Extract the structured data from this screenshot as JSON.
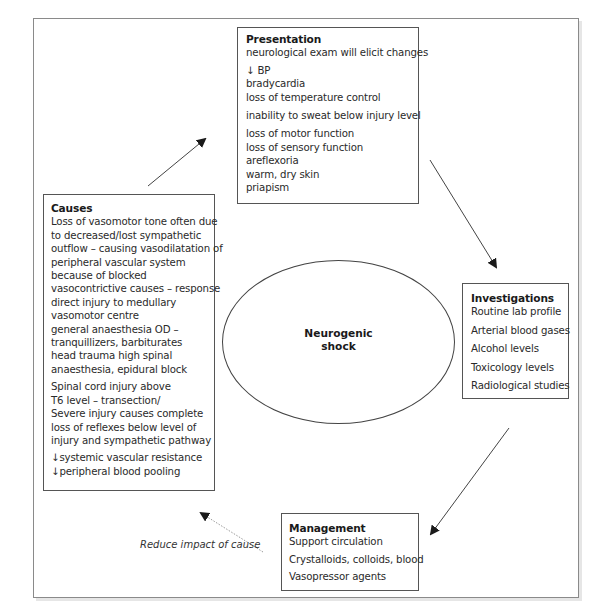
{
  "diagram": {
    "center": {
      "line1": "Neurogenic",
      "line2": "shock"
    },
    "presentation": {
      "title": "Presentation",
      "items": [
        "neurological exam will elicit changes",
        "↓ BP",
        "bradycardia",
        "loss of temperature control",
        "inability to sweat below injury level",
        "loss of motor function",
        "loss of sensory function",
        "areflexoria",
        "warm, dry skin",
        "priapism"
      ]
    },
    "causes": {
      "title": "Causes",
      "items": [
        "Loss of vasomotor tone often due",
        "to decreased/lost sympathetic",
        "outflow – causing vasodilatation of",
        "peripheral vascular system",
        "because of blocked",
        "vasocontrictive causes – response",
        "direct injury to medullary",
        "vasomotor centre",
        "general anaesthesia OD –",
        "tranquillizers, barbiturates",
        "head trauma high spinal",
        "anaesthesia, epidural block",
        "Spinal cord injury above",
        "T6 level – transection/",
        "Severe injury causes complete",
        "loss of reflexes below level of",
        "injury and sympathetic pathway",
        "↓systemic vascular resistance",
        "↓peripheral blood pooling"
      ]
    },
    "investigations": {
      "title": "Investigations",
      "items": [
        "Routine lab profile",
        "Arterial blood gases",
        "Alcohol levels",
        "Toxicology levels",
        "Radiological studies"
      ]
    },
    "management": {
      "title": "Management",
      "items": [
        "Support circulation",
        "Crystalloids, colloids, blood",
        "Vasopressor agents"
      ]
    },
    "annotations": {
      "dotted_arrow_label": "Reduce impact of cause"
    },
    "colors": {
      "line": "#444444",
      "frame": "#8a8a8a",
      "dotted_arrow": "#9a9a9a",
      "text": "#2a2a2a"
    }
  }
}
